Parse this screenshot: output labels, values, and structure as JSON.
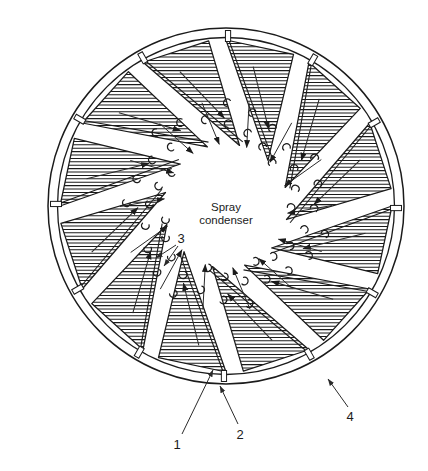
{
  "figure": {
    "name": "spray-condenser-cross-section",
    "center_label": {
      "line1": "Spray",
      "line2": "condenser"
    },
    "callouts": [
      {
        "id": "1",
        "label": "1",
        "target": "vane-body"
      },
      {
        "id": "2",
        "label": "2",
        "target": "vane-gap-connector"
      },
      {
        "id": "3",
        "label": "3",
        "target": "spray-droplets"
      },
      {
        "id": "4",
        "label": "4",
        "target": "outer-shell-wall"
      }
    ],
    "colors": {
      "line": "#1b1b1b",
      "hatch": "#1b1b1b",
      "background": "#ffffff",
      "leader": "#3a3a3a"
    },
    "geometry": {
      "center_x": 226,
      "center_y": 206,
      "outer_radius": 178,
      "inner_radius": 168,
      "vane_count": 12,
      "vane_inner_radius": 62,
      "droplet_ring_inner": 60,
      "droplet_ring_outer": 104
    }
  }
}
